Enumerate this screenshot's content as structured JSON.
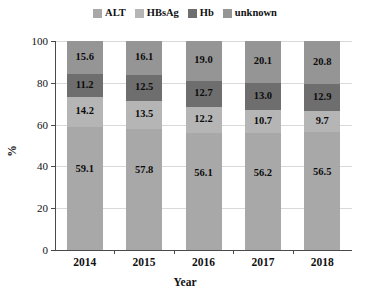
{
  "chart_data": {
    "type": "bar",
    "stacked": true,
    "stack_mode": "percent",
    "title": "",
    "xlabel": "Year",
    "ylabel": "%",
    "categories": [
      "2014",
      "2015",
      "2016",
      "2017",
      "2018"
    ],
    "ylim": [
      0,
      100
    ],
    "yticks": [
      0,
      20,
      40,
      60,
      80,
      100
    ],
    "ytick_labels": [
      "0",
      "20",
      "40",
      "60",
      "80",
      "100"
    ],
    "grid": true,
    "grid_axis": "y",
    "legend_position": "top-center",
    "series": [
      {
        "name": "ALT",
        "color": "#a8a8a8",
        "values": [
          59.1,
          57.8,
          56.1,
          56.2,
          56.5
        ],
        "labels": [
          "59.1",
          "57.8",
          "56.1",
          "56.2",
          "56.5"
        ]
      },
      {
        "name": "HBsAg",
        "color": "#b5b5b5",
        "values": [
          14.2,
          13.5,
          12.2,
          10.7,
          9.7
        ],
        "labels": [
          "14.2",
          "13.5",
          "12.2",
          "10.7",
          "9.7"
        ]
      },
      {
        "name": "Hb",
        "color": "#6e6e6e",
        "values": [
          11.2,
          12.5,
          12.7,
          13.0,
          12.9
        ],
        "labels": [
          "11.2",
          "12.5",
          "12.7",
          "13.0",
          "12.9"
        ]
      },
      {
        "name": "unknown",
        "color": "#959595",
        "values": [
          15.6,
          16.1,
          19.0,
          20.1,
          20.8
        ],
        "labels": [
          "15.6",
          "16.1",
          "19.0",
          "20.1",
          "20.8"
        ]
      }
    ]
  }
}
